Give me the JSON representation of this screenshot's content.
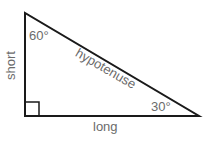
{
  "diagram": {
    "labels": {
      "top_angle": "60°",
      "right_angle_vertex": "30°",
      "hypotenuse": "hypotenuse",
      "short_side": "short",
      "long_side": "long"
    },
    "colors": {
      "stroke": "#1a1a1a",
      "text": "#6b6b6b"
    }
  }
}
